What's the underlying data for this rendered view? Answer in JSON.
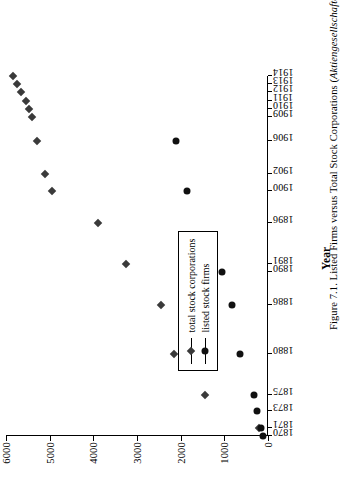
{
  "figure": {
    "caption": "Figure 7.1. Listed Firms versus Total Stock Corporations (Aktiengesellschaften), 1870–1914."
  },
  "chart_data": {
    "type": "scatter",
    "title": "",
    "xlabel": "Year",
    "ylabel": "",
    "ylim": [
      0,
      6000
    ],
    "yticks": [
      0,
      1000,
      2000,
      3000,
      4000,
      5000,
      6000
    ],
    "ytick_labels": [
      "0",
      "1000",
      "2000",
      "3000",
      "4000",
      "5000",
      "6000"
    ],
    "xlim": [
      1870,
      1914
    ],
    "xticks": [
      1870,
      1871,
      1873,
      1875,
      1880,
      1886,
      1890,
      1891,
      1896,
      1900,
      1902,
      1906,
      1909,
      1910,
      1911,
      1912,
      1913,
      1914
    ],
    "xtick_labels": [
      "1870",
      "1871",
      "1873",
      "1875",
      "1880",
      "1886",
      "1890",
      "1891",
      "1896",
      "1900",
      "1902",
      "1906",
      "1909",
      "1910",
      "1911",
      "1912",
      "1913",
      "1914"
    ],
    "grid": false,
    "legend_position": "lower-left",
    "series": [
      {
        "name": "total stock corporations",
        "marker": "diamond",
        "color": "#3a3a3a",
        "points": [
          {
            "x": 1871,
            "y": 200
          },
          {
            "x": 1875,
            "y": 1450
          },
          {
            "x": 1880,
            "y": 2150
          },
          {
            "x": 1886,
            "y": 2450
          },
          {
            "x": 1891,
            "y": 3250
          },
          {
            "x": 1896,
            "y": 3900
          },
          {
            "x": 1900,
            "y": 4950
          },
          {
            "x": 1902,
            "y": 5100
          },
          {
            "x": 1906,
            "y": 5300
          },
          {
            "x": 1909,
            "y": 5400
          },
          {
            "x": 1910,
            "y": 5480
          },
          {
            "x": 1911,
            "y": 5550
          },
          {
            "x": 1912,
            "y": 5650
          },
          {
            "x": 1913,
            "y": 5750
          },
          {
            "x": 1914,
            "y": 5850
          }
        ]
      },
      {
        "name": "listed stock firms",
        "marker": "circle",
        "color": "#111111",
        "points": [
          {
            "x": 1870,
            "y": 120
          },
          {
            "x": 1871,
            "y": 170
          },
          {
            "x": 1873,
            "y": 260
          },
          {
            "x": 1875,
            "y": 330
          },
          {
            "x": 1880,
            "y": 640
          },
          {
            "x": 1886,
            "y": 830
          },
          {
            "x": 1890,
            "y": 1060
          },
          {
            "x": 1900,
            "y": 1850
          },
          {
            "x": 1906,
            "y": 2100
          }
        ]
      }
    ]
  },
  "legend": {
    "items": [
      {
        "label": "total stock corporations"
      },
      {
        "label": "listed stock firms"
      }
    ]
  }
}
